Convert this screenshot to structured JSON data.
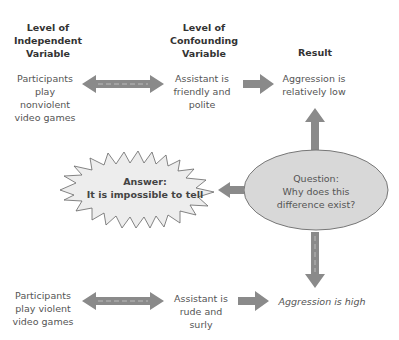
{
  "headers": {
    "independent": "Level of Independent Variable",
    "confounding": "Level of Confounding Variable",
    "result": "Result"
  },
  "row_top": {
    "independent": "Participants play nonviolent video games",
    "confounding": "Assistant is friendly and polite",
    "result": "Aggression is relatively low"
  },
  "row_bottom": {
    "independent": "Participants play violent video games",
    "confounding": "Assistant is rude and surly",
    "result": "Aggression is high"
  },
  "question": {
    "label": "Question:",
    "text": "Why does this difference exist?"
  },
  "answer": {
    "label": "Answer:",
    "text": "It is impossible to tell"
  },
  "colors": {
    "arrow": "#8a8a8a",
    "ellipse": "#d8d8d8",
    "burst": "#ededed"
  }
}
